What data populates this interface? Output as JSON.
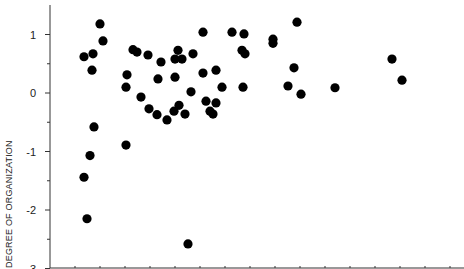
{
  "chart_data": {
    "type": "scatter",
    "title": "",
    "xlabel": "",
    "ylabel": "DEGREE OF ORGANIZATION",
    "ylim": [
      -3,
      1.5
    ],
    "yticks": [
      1,
      0,
      -1,
      -2,
      -3
    ],
    "ytick_labels": [
      "1",
      "0",
      "-1",
      "-2",
      "-3"
    ],
    "grid": false,
    "legend": null,
    "x_note": "x-axis tick labels not visible; x given in relative pixel units",
    "points": [
      {
        "x": 100,
        "y": 1.18
      },
      {
        "x": 103,
        "y": 0.89
      },
      {
        "x": 84,
        "y": 0.62
      },
      {
        "x": 93,
        "y": 0.67
      },
      {
        "x": 92,
        "y": 0.39
      },
      {
        "x": 94,
        "y": -0.58
      },
      {
        "x": 90,
        "y": -1.07
      },
      {
        "x": 84,
        "y": -1.44
      },
      {
        "x": 87,
        "y": -2.15
      },
      {
        "x": 127,
        "y": 0.31
      },
      {
        "x": 126,
        "y": 0.1
      },
      {
        "x": 126,
        "y": -0.89
      },
      {
        "x": 133,
        "y": 0.74
      },
      {
        "x": 137,
        "y": 0.7
      },
      {
        "x": 148,
        "y": 0.65
      },
      {
        "x": 161,
        "y": 0.53
      },
      {
        "x": 178,
        "y": 0.73
      },
      {
        "x": 175,
        "y": 0.58
      },
      {
        "x": 182,
        "y": 0.58
      },
      {
        "x": 193,
        "y": 0.67
      },
      {
        "x": 158,
        "y": 0.24
      },
      {
        "x": 175,
        "y": 0.27
      },
      {
        "x": 141,
        "y": -0.07
      },
      {
        "x": 191,
        "y": 0.02
      },
      {
        "x": 149,
        "y": -0.27
      },
      {
        "x": 157,
        "y": -0.37
      },
      {
        "x": 167,
        "y": -0.46
      },
      {
        "x": 174,
        "y": -0.31
      },
      {
        "x": 179,
        "y": -0.21
      },
      {
        "x": 185,
        "y": -0.36
      },
      {
        "x": 188,
        "y": -2.58
      },
      {
        "x": 203,
        "y": 1.04
      },
      {
        "x": 232,
        "y": 1.04
      },
      {
        "x": 244,
        "y": 1.01
      },
      {
        "x": 273,
        "y": 0.92
      },
      {
        "x": 273,
        "y": 0.85
      },
      {
        "x": 242,
        "y": 0.73
      },
      {
        "x": 245,
        "y": 0.67
      },
      {
        "x": 203,
        "y": 0.34
      },
      {
        "x": 216,
        "y": 0.39
      },
      {
        "x": 222,
        "y": 0.1
      },
      {
        "x": 243,
        "y": 0.1
      },
      {
        "x": 206,
        "y": -0.14
      },
      {
        "x": 216,
        "y": -0.17
      },
      {
        "x": 210,
        "y": -0.31
      },
      {
        "x": 213,
        "y": -0.36
      },
      {
        "x": 297,
        "y": 1.21
      },
      {
        "x": 294,
        "y": 0.43
      },
      {
        "x": 288,
        "y": 0.12
      },
      {
        "x": 301,
        "y": -0.02
      },
      {
        "x": 335,
        "y": 0.09
      },
      {
        "x": 392,
        "y": 0.58
      },
      {
        "x": 402,
        "y": 0.22
      }
    ]
  },
  "axes": {
    "y_label": "DEGREE OF ORGANIZATION",
    "y_tick_labels": [
      "1",
      "0",
      "-1",
      "-2",
      "-3"
    ]
  },
  "style": {
    "point_color": "#000000",
    "axis_color": "#333333"
  }
}
